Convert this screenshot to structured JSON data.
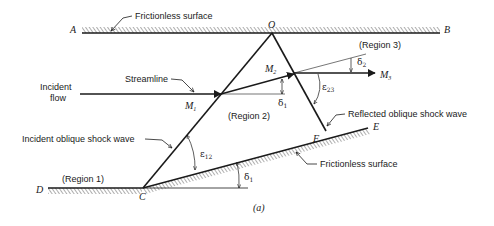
{
  "figure": {
    "caption": "(a)",
    "points": {
      "A": "A",
      "B": "B",
      "O": "O",
      "C": "C",
      "D": "D",
      "E": "E",
      "F": "F"
    },
    "regions": {
      "region1": "(Region 1)",
      "region2": "(Region 2)",
      "region3": "(Region 3)"
    },
    "labels": {
      "frictionless_top": "Frictionless surface",
      "frictionless_bottom": "Frictionless surface",
      "streamline": "Streamline",
      "incident_flow_line1": "Incident",
      "incident_flow_line2": "flow",
      "incident_shock": "Incident oblique shock wave",
      "reflected_shock": "Reflected oblique shock wave"
    },
    "symbols": {
      "M1": "M",
      "M1_sub": "1",
      "M2": "M",
      "M2_sub": "2",
      "M3": "M",
      "M3_sub": "3",
      "delta1_upper": "δ",
      "delta1_upper_sub": "1",
      "delta1_lower": "δ",
      "delta1_lower_sub": "1",
      "delta2": "δ",
      "delta2_sub": "2",
      "eps12": "ε",
      "eps12_sub": "12",
      "eps23": "ε",
      "eps23_sub": "23"
    },
    "colors": {
      "ink": "#1a1a1a",
      "background": "#ffffff"
    }
  }
}
